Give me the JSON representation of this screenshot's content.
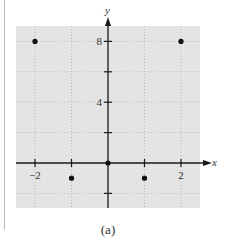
{
  "chart_data": {
    "type": "scatter",
    "title": "",
    "caption": "(a)",
    "xlabel": "x",
    "ylabel": "y",
    "xlim": [
      -2.5,
      2.5
    ],
    "ylim": [
      -3,
      10
    ],
    "x_ticks": [
      -2,
      -1,
      0,
      1,
      2
    ],
    "x_tick_labels": [
      {
        "value": -2,
        "label": "−2"
      },
      {
        "value": 2,
        "label": "2"
      }
    ],
    "y_ticks": [
      -2,
      2,
      4,
      6,
      8
    ],
    "y_tick_labels": [
      {
        "value": 4,
        "label": "4"
      },
      {
        "value": 8,
        "label": "8"
      }
    ],
    "grid": true,
    "series": [
      {
        "name": "points",
        "points": [
          {
            "x": -2,
            "y": 8
          },
          {
            "x": -1,
            "y": -1
          },
          {
            "x": 0,
            "y": 0
          },
          {
            "x": 1,
            "y": -1
          },
          {
            "x": 2,
            "y": 8
          }
        ]
      }
    ],
    "colors": {
      "plot_background": "#e4e4e4",
      "axis": "#1a1a1a",
      "grid": "#bdbdbd",
      "points": "#111111"
    }
  }
}
